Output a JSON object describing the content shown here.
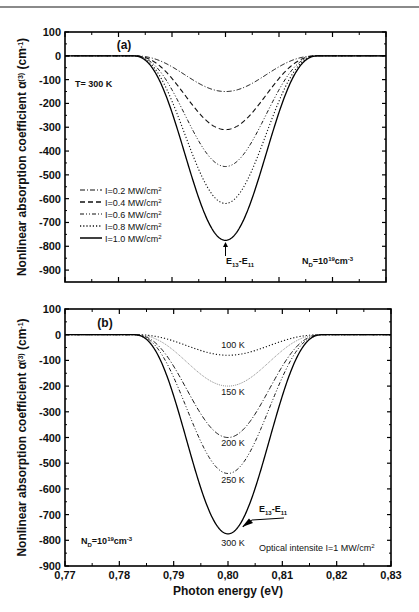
{
  "chart_data": [
    {
      "panel": "(a)",
      "type": "line",
      "title": "",
      "xlabel": "Photon energy (eV)",
      "ylabel": "Nonlinear absorption coefficient α(3) (cm-1)",
      "xlim": [
        0.77,
        0.83
      ],
      "ylim": [
        -950,
        100
      ],
      "yticks": [
        100,
        0,
        -100,
        -200,
        -300,
        -400,
        -500,
        -600,
        -700,
        -800,
        -900
      ],
      "xticks": [
        "0,77",
        "0,78",
        "0,79",
        "0,80",
        "0,81",
        "0,82",
        "0,83"
      ],
      "grid": false,
      "legend_position": "lower-left",
      "peak_energy_eV": 0.8,
      "series": [
        {
          "name": "I=0.2 MW/cm2",
          "style": "dash-dot",
          "min_value": -150
        },
        {
          "name": "I=0.4 MW/cm2",
          "style": "dashed",
          "min_value": -310
        },
        {
          "name": "I=0.6 MW/cm2",
          "style": "dash-dot-dot",
          "min_value": -465
        },
        {
          "name": "I=0.8 MW/cm2",
          "style": "dotted",
          "min_value": -620
        },
        {
          "name": "I=1.0 MW/cm2",
          "style": "solid",
          "min_value": -775
        }
      ],
      "x": [
        0.77,
        0.78,
        0.783,
        0.786,
        0.789,
        0.792,
        0.795,
        0.798,
        0.8,
        0.802,
        0.805,
        0.808,
        0.811,
        0.814,
        0.817,
        0.82,
        0.83
      ],
      "annotations": [
        "T= 300 K",
        "E13-E11",
        "ND=10^19 cm^-3",
        "(a)"
      ]
    },
    {
      "panel": "(b)",
      "type": "line",
      "title": "",
      "xlabel": "Photon energy (eV)",
      "ylabel": "Nonlinear absorption coefficient α(3) (cm-1)",
      "xlim": [
        0.77,
        0.83
      ],
      "ylim": [
        -900,
        100
      ],
      "yticks": [
        100,
        0,
        -100,
        -200,
        -300,
        -400,
        -500,
        -600,
        -700,
        -800,
        -900
      ],
      "xticks": [
        "0,77",
        "0,78",
        "0,79",
        "0,80",
        "0,81",
        "0,82",
        "0,83"
      ],
      "grid": false,
      "peak_energy_eV": 0.8,
      "series": [
        {
          "name": "100 K",
          "style": "dotted",
          "min_value": -80
        },
        {
          "name": "150 K",
          "style": "fine-dotted-gray",
          "min_value": -200
        },
        {
          "name": "200 K",
          "style": "dash-dot",
          "min_value": -400
        },
        {
          "name": "250 K",
          "style": "dash-dot-dot",
          "min_value": -540
        },
        {
          "name": "300 K",
          "style": "solid",
          "min_value": -775
        }
      ],
      "annotations": [
        "ND=10^19 cm^-3",
        "Optical intensite I=1 MW/cm2",
        "E13-E11",
        "(b)"
      ]
    }
  ],
  "panel_a": {
    "label": "(a)",
    "temp": "T= 300 K",
    "transition_main": "E",
    "transition_sub1": "13",
    "transition_mid": "-E",
    "transition_sub2": "11",
    "doping_main": "N",
    "doping_sub": "D",
    "doping_eq": "=10",
    "doping_exp": "19",
    "doping_unit": "cm",
    "doping_unit_exp": "-3",
    "legend": [
      {
        "text": "I=0.2 MW/cm",
        "sup": "2"
      },
      {
        "text": "I=0.4 MW/cm",
        "sup": "2"
      },
      {
        "text": "I=0.6 MW/cm",
        "sup": "2"
      },
      {
        "text": "I=0.8 MW/cm",
        "sup": "2"
      },
      {
        "text": "I=1.0 MW/cm",
        "sup": "2"
      }
    ]
  },
  "panel_b": {
    "label": "(b)",
    "curve_labels": [
      "100 K",
      "150 K",
      "200 K",
      "250 K",
      "300 K"
    ],
    "intensity_text": "Optical intensite I=1 MW/cm",
    "intensity_sup": "2",
    "transition_main": "E",
    "transition_sub1": "13",
    "transition_mid": "-E",
    "transition_sub2": "11",
    "doping_main": "N",
    "doping_sub": "D",
    "doping_eq": "=10",
    "doping_exp": "19",
    "doping_unit": "cm",
    "doping_unit_exp": "-3"
  },
  "axes": {
    "ylabel_main": "Nonlinear absorption coefficient α",
    "ylabel_sup": "(3)",
    "ylabel_unit": " (cm",
    "ylabel_unit_sup": "-1",
    "ylabel_close": ")",
    "xlabel": "Photon energy (eV)",
    "yticks": [
      "100",
      "0",
      "-100",
      "-200",
      "-300",
      "-400",
      "-500",
      "-600",
      "-700",
      "-800",
      "-900"
    ],
    "xticks": [
      "0,77",
      "0,78",
      "0,79",
      "0,80",
      "0,81",
      "0,82",
      "0,83"
    ]
  }
}
